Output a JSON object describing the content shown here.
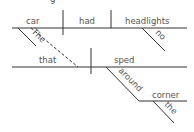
{
  "diagram": {
    "type": "sentence-diagram",
    "main_clause": {
      "subject": "car",
      "verb": "had",
      "object": "headlights",
      "subject_modifier": "The",
      "object_modifier": "no"
    },
    "relative_clause": {
      "subject": "that",
      "verb": "sped",
      "prep": "around",
      "prep_object": "corner",
      "prep_object_modifier": "the"
    },
    "top_cropped_text": "g"
  }
}
